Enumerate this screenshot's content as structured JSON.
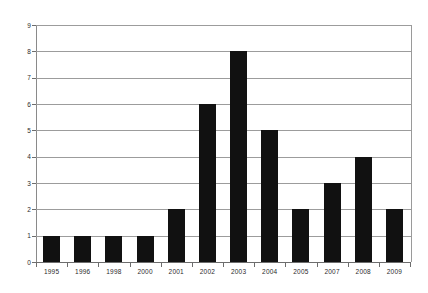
{
  "chart_data": {
    "type": "bar",
    "title": "",
    "subtitle": "",
    "xlabel": "",
    "ylabel": "",
    "categories": [
      "1995",
      "1996",
      "1998",
      "2000",
      "2001",
      "2002",
      "2003",
      "2004",
      "2005",
      "2007",
      "2008",
      "2009"
    ],
    "values": [
      1,
      1,
      1,
      1,
      2,
      6,
      8,
      5,
      2,
      3,
      4,
      2
    ],
    "ylim": [
      0,
      9
    ],
    "ytick_labels": [
      "0",
      "1",
      "2",
      "3",
      "4",
      "5",
      "6",
      "7",
      "8",
      "9"
    ],
    "ytick_values": [
      0,
      1,
      2,
      3,
      4,
      5,
      6,
      7,
      8,
      9
    ],
    "grid": true,
    "legend": null,
    "annotations": [],
    "colors": {
      "bar": "#111111",
      "gridline": "#9c9c9c",
      "axis": "#6d6d6d",
      "text": "#2b2b2b",
      "background": "#ffffff"
    }
  }
}
